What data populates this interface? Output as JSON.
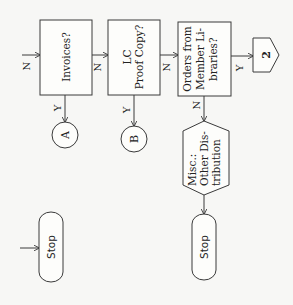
{
  "diagram": {
    "type": "flowchart",
    "orientation": "rotated 90 degrees (text reads bottom-to-top)",
    "nodes": {
      "invoices": {
        "label": "Invoices?",
        "shape": "decision-box"
      },
      "lc_proof": {
        "line1": "LC",
        "line2": "Proof Copy?",
        "shape": "decision-box"
      },
      "orders": {
        "line1": "Orders from",
        "line2": "Member Li-",
        "line3": "braries?",
        "shape": "decision-box"
      },
      "connector_2": {
        "label": "2",
        "shape": "off-page-connector"
      },
      "connector_a": {
        "label": "A",
        "shape": "circle-connector"
      },
      "connector_b": {
        "label": "B",
        "shape": "circle-connector"
      },
      "misc": {
        "line1": "Misc.:",
        "line2": "Other Dis-",
        "line3": "tribution",
        "shape": "hexagon"
      },
      "stop_left": {
        "label": "Stop",
        "shape": "terminator"
      },
      "stop_right": {
        "label": "Stop",
        "shape": "terminator"
      }
    },
    "edge_labels": {
      "entry_invoices": "N",
      "invoices_to_lc": "N",
      "lc_to_orders": "N",
      "orders_to_2": "Y",
      "invoices_to_a": "Y",
      "lc_to_b": "Y",
      "orders_to_misc": "N"
    },
    "colors": {
      "stroke": "#3a3a3a",
      "background": "#f7f7f5",
      "text": "#222222"
    }
  }
}
